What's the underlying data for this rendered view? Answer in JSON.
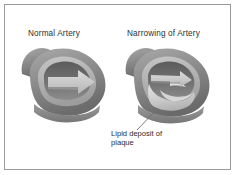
{
  "figure": {
    "domain_kind": "medical-illustration",
    "background_color": "#ffffff",
    "frame_color": "#9a9a9a",
    "panels": [
      {
        "id": "normal-artery",
        "title": "Normal Artery",
        "description": "Cut-away cross-section of a healthy artery with a wide open lumen and a large block arrow showing unobstructed blood flow to the right.",
        "flow_arrow": "large",
        "lumen": "open"
      },
      {
        "id": "narrowing-artery",
        "title": "Narrowing of Artery",
        "description": "Cut-away cross-section of an artery whose lumen is partly filled by a pale lipid plaque mass, leaving a thin compressed block arrow of reduced blood flow.",
        "flow_arrow": "small",
        "lumen": "narrowed"
      }
    ],
    "callout": {
      "line1": "Lipid deposit of",
      "line2": "plaque",
      "target_panel": "narrowing-artery"
    },
    "palette": {
      "wall_dark": "#6f6f6f",
      "wall_mid": "#8c8c8c",
      "wall_light": "#a8a8a8",
      "intima": "#bdbdbd",
      "lumen_shadow": "#5f5f5f",
      "arrow_fill": "#cfcfcf",
      "plaque": "#d8d8d8",
      "leader_line": "#6b6b6b",
      "text": "#2e2e2e"
    }
  }
}
